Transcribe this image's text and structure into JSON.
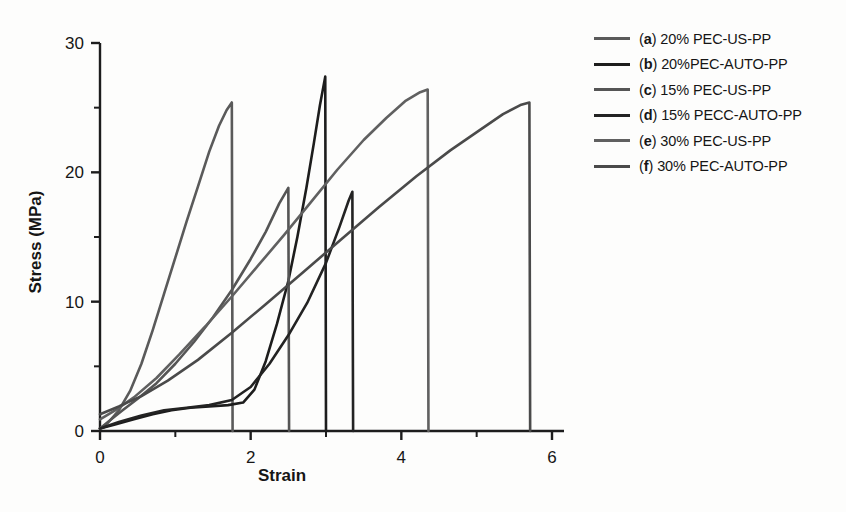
{
  "chart_data": {
    "type": "line",
    "title": "",
    "xlabel": "Strain",
    "ylabel": "Stress (MPa)",
    "xlim": [
      0,
      6
    ],
    "ylim": [
      0,
      30
    ],
    "xticks": [
      0,
      2,
      4,
      6
    ],
    "xticklabels": [
      "0",
      "2",
      "4",
      "6"
    ],
    "xminorticks": [
      1,
      3,
      5
    ],
    "yticks": [
      0,
      10,
      20,
      30
    ],
    "yticklabels": [
      "0",
      "10",
      "20",
      "30"
    ],
    "yminorticks": [
      5,
      15,
      25
    ],
    "grid": false,
    "legend_position": "right",
    "series": [
      {
        "key": "a",
        "name": "(a) 20% PEC-US-PP",
        "prefix": "a",
        "label_rest": ") 20% PEC-US-PP",
        "color": "#5a5a5a",
        "peak_strain": 1.75,
        "peak_stress": 25.4,
        "points": [
          [
            0.0,
            0.2
          ],
          [
            0.1,
            0.6
          ],
          [
            0.25,
            1.6
          ],
          [
            0.4,
            3.1
          ],
          [
            0.55,
            5.2
          ],
          [
            0.7,
            7.8
          ],
          [
            0.85,
            10.6
          ],
          [
            1.0,
            13.4
          ],
          [
            1.15,
            16.2
          ],
          [
            1.3,
            18.9
          ],
          [
            1.45,
            21.6
          ],
          [
            1.58,
            23.6
          ],
          [
            1.68,
            24.8
          ],
          [
            1.75,
            25.4
          ],
          [
            1.76,
            0.0
          ]
        ]
      },
      {
        "key": "b",
        "name": "(b) 20%PEC-AUTO-PP",
        "prefix": "b",
        "label_rest": ") 20%PEC-AUTO-PP",
        "color": "#1d1d1d",
        "peak_strain": 2.99,
        "peak_stress": 27.4,
        "points": [
          [
            0.0,
            0.2
          ],
          [
            0.2,
            0.5
          ],
          [
            0.45,
            0.9
          ],
          [
            0.7,
            1.3
          ],
          [
            0.95,
            1.6
          ],
          [
            1.2,
            1.8
          ],
          [
            1.45,
            1.9
          ],
          [
            1.7,
            2.0
          ],
          [
            1.9,
            2.2
          ],
          [
            2.05,
            3.2
          ],
          [
            2.2,
            5.4
          ],
          [
            2.35,
            8.3
          ],
          [
            2.5,
            11.6
          ],
          [
            2.62,
            15.0
          ],
          [
            2.74,
            18.8
          ],
          [
            2.84,
            22.3
          ],
          [
            2.92,
            25.2
          ],
          [
            2.99,
            27.4
          ],
          [
            3.0,
            0.0
          ]
        ]
      },
      {
        "key": "c",
        "name": "(c) 15% PEC-US-PP",
        "prefix": "c",
        "label_rest": ") 15% PEC-US-PP",
        "color": "#555555",
        "peak_strain": 2.5,
        "peak_stress": 18.8,
        "points": [
          [
            0.0,
            0.2
          ],
          [
            0.15,
            0.9
          ],
          [
            0.3,
            1.6
          ],
          [
            0.5,
            2.5
          ],
          [
            0.75,
            3.7
          ],
          [
            1.0,
            5.2
          ],
          [
            1.25,
            6.9
          ],
          [
            1.5,
            8.8
          ],
          [
            1.75,
            10.9
          ],
          [
            2.0,
            13.3
          ],
          [
            2.2,
            15.4
          ],
          [
            2.38,
            17.6
          ],
          [
            2.5,
            18.8
          ],
          [
            2.51,
            0.0
          ]
        ]
      },
      {
        "key": "d",
        "name": "(d) 15% PECC-AUTO-PP",
        "prefix": "d",
        "label_rest": ") 15% PECC-AUTO-PP",
        "color": "#232323",
        "peak_strain": 3.35,
        "peak_stress": 18.5,
        "points": [
          [
            0.0,
            0.2
          ],
          [
            0.25,
            0.7
          ],
          [
            0.55,
            1.2
          ],
          [
            0.85,
            1.6
          ],
          [
            1.15,
            1.8
          ],
          [
            1.45,
            2.0
          ],
          [
            1.75,
            2.4
          ],
          [
            2.0,
            3.4
          ],
          [
            2.25,
            5.2
          ],
          [
            2.5,
            7.4
          ],
          [
            2.75,
            9.9
          ],
          [
            3.0,
            13.0
          ],
          [
            3.18,
            15.8
          ],
          [
            3.3,
            17.8
          ],
          [
            3.35,
            18.5
          ],
          [
            3.36,
            0.0
          ]
        ]
      },
      {
        "key": "e",
        "name": "(e) 30% PEC-US-PP",
        "prefix": "e",
        "label_rest": ") 30% PEC-US-PP",
        "color": "#606060",
        "peak_strain": 4.35,
        "peak_stress": 26.4,
        "points": [
          [
            0.0,
            0.9
          ],
          [
            0.2,
            1.6
          ],
          [
            0.45,
            2.6
          ],
          [
            0.75,
            4.1
          ],
          [
            1.05,
            5.9
          ],
          [
            1.4,
            8.1
          ],
          [
            1.75,
            10.4
          ],
          [
            2.1,
            12.8
          ],
          [
            2.45,
            15.2
          ],
          [
            2.8,
            17.7
          ],
          [
            3.15,
            20.2
          ],
          [
            3.5,
            22.5
          ],
          [
            3.8,
            24.2
          ],
          [
            4.05,
            25.5
          ],
          [
            4.25,
            26.2
          ],
          [
            4.35,
            26.4
          ],
          [
            4.36,
            0.0
          ]
        ]
      },
      {
        "key": "f",
        "name": "(f) 30% PEC-AUTO-PP",
        "prefix": "f",
        "label_rest": ") 30% PEC-AUTO-PP",
        "color": "#4a4a4a",
        "peak_strain": 5.7,
        "peak_stress": 25.4,
        "points": [
          [
            0.0,
            1.3
          ],
          [
            0.25,
            1.9
          ],
          [
            0.55,
            2.7
          ],
          [
            0.9,
            3.9
          ],
          [
            1.3,
            5.5
          ],
          [
            1.75,
            7.6
          ],
          [
            2.2,
            9.8
          ],
          [
            2.7,
            12.3
          ],
          [
            3.2,
            14.8
          ],
          [
            3.7,
            17.3
          ],
          [
            4.2,
            19.7
          ],
          [
            4.65,
            21.7
          ],
          [
            5.05,
            23.3
          ],
          [
            5.35,
            24.5
          ],
          [
            5.58,
            25.2
          ],
          [
            5.7,
            25.4
          ],
          [
            5.71,
            0.0
          ]
        ]
      }
    ]
  },
  "legend": {
    "items": [
      {
        "prefix": "a",
        "rest": ") 20% PEC-US-PP",
        "color": "#5a5a5a"
      },
      {
        "prefix": "b",
        "rest": ") 20%PEC-AUTO-PP",
        "color": "#1d1d1d"
      },
      {
        "prefix": "c",
        "rest": ") 15% PEC-US-PP",
        "color": "#555555"
      },
      {
        "prefix": "d",
        "rest": ") 15% PECC-AUTO-PP",
        "color": "#232323"
      },
      {
        "prefix": "e",
        "rest": ") 30% PEC-US-PP",
        "color": "#606060"
      },
      {
        "prefix": "f",
        "rest": ") 30% PEC-AUTO-PP",
        "color": "#4a4a4a"
      }
    ],
    "open_paren": "(",
    "close_hidden": ""
  }
}
